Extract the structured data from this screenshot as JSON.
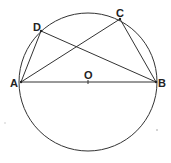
{
  "diagram": {
    "type": "circle-geometry",
    "circle": {
      "cx": 88,
      "cy": 82,
      "r": 69,
      "stroke": "#444444"
    },
    "points": {
      "A": {
        "x": 21,
        "y": 82,
        "label": "A",
        "lx": 10,
        "ly": 87
      },
      "B": {
        "x": 156,
        "y": 82,
        "label": "B",
        "lx": 158,
        "ly": 87
      },
      "C": {
        "x": 120,
        "y": 19,
        "label": "C",
        "lx": 117,
        "ly": 16
      },
      "D": {
        "x": 41,
        "y": 31,
        "label": "D",
        "lx": 33,
        "ly": 30
      },
      "O": {
        "x": 88,
        "y": 82,
        "label": "O",
        "lx": 84,
        "ly": 79
      }
    },
    "segments": [
      "AB",
      "AD",
      "AC",
      "DB",
      "CB"
    ]
  }
}
